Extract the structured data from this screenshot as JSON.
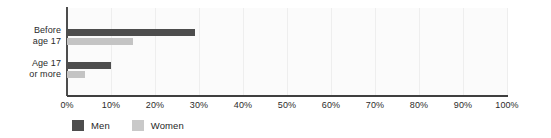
{
  "chart_data": {
    "type": "bar",
    "orientation": "horizontal",
    "title": "",
    "subtitle": "",
    "xlabel": "",
    "ylabel": "",
    "categories": [
      "Before age 17",
      "Age 17 or more"
    ],
    "category_lines": [
      [
        "Before",
        "age 17"
      ],
      [
        "Age 17",
        "or more"
      ]
    ],
    "series": [
      {
        "name": "Men",
        "values": [
          29,
          10
        ],
        "color": "#4d4d4d"
      },
      {
        "name": "Women",
        "values": [
          15,
          4
        ],
        "color": "#c4c4c4"
      }
    ],
    "xlim": [
      0,
      100
    ],
    "xticks": [
      0,
      10,
      20,
      30,
      40,
      50,
      60,
      70,
      80,
      90,
      100
    ],
    "xtick_labels": [
      "0%",
      "10%",
      "20%",
      "30%",
      "40%",
      "50%",
      "60%",
      "70%",
      "80%",
      "90%",
      "100%"
    ],
    "grid": "vertical",
    "legend_position": "bottom-left",
    "value_format": "percent"
  },
  "legend": {
    "items": [
      {
        "label": "Men",
        "color": "#4d4d4d"
      },
      {
        "label": "Women",
        "color": "#c9c9c9"
      }
    ]
  },
  "colors": {
    "men": "#4d4d4d",
    "women": "#c4c4c4",
    "axis": "#3f3f3f",
    "grid": "#eeeeee",
    "plot_background": "#fbfbfb",
    "text": "#2b2b2b"
  }
}
